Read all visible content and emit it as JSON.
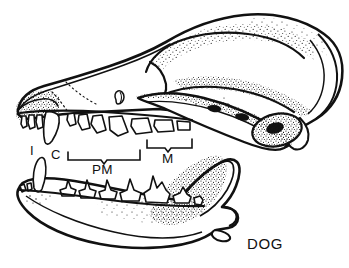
{
  "figure": {
    "caption": "DOG",
    "background_color": "#ffffff",
    "ink_color": "#111111",
    "style": "stippled pen-and-ink scientific line drawing",
    "view": "left lateral",
    "width": 349,
    "height": 268
  },
  "labels": {
    "incisor": "I",
    "canine": "C",
    "premolar": "PM",
    "molar": "M"
  },
  "label_meanings": {
    "I": "incisors",
    "C": "canine",
    "PM": "premolars",
    "M": "molars"
  },
  "structures": {
    "cranium": "cranium",
    "rostrum": "rostrum",
    "orbit": "orbit",
    "zygomatic_arch": "zygomatic arch",
    "auditory_bulla": "auditory bulla",
    "external_auditory_meatus": "external auditory meatus",
    "occipital": "occipital region",
    "sagittal_crest": "sagittal crest",
    "mandible": "mandible",
    "coronoid_process": "coronoid process",
    "condylar_process": "condylar process",
    "angular_process": "angular process",
    "upper_tooth_row": "upper tooth row",
    "lower_tooth_row": "lower tooth row"
  },
  "brackets": {
    "premolar_bracket": "premolar span bracket",
    "molar_bracket": "molar span bracket"
  }
}
